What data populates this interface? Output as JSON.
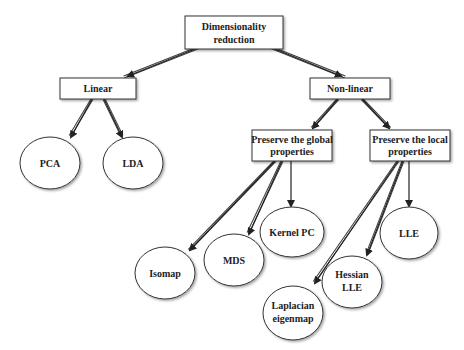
{
  "diagram": {
    "root": {
      "line1": "Dimensionality",
      "line2": "reduction"
    },
    "linear": {
      "label": "Linear"
    },
    "nonlinear": {
      "label": "Non-linear"
    },
    "global": {
      "line1": "Preserve the global",
      "line2": "properties"
    },
    "local": {
      "line1": "Preserve the local",
      "line2": "properties"
    },
    "leaves": {
      "pca": "PCA",
      "lda": "LDA",
      "kernel_pc": "Kernel PC",
      "mds": "MDS",
      "isomap": "Isomap",
      "lle": "LLE",
      "hessian_1": "Hessian",
      "hessian_2": "LLE",
      "laplacian_1": "Laplacian",
      "laplacian_2": "eigenmap"
    },
    "colors": {
      "stroke": "#333333",
      "fill": "#ffffff",
      "text": "#222222"
    }
  }
}
